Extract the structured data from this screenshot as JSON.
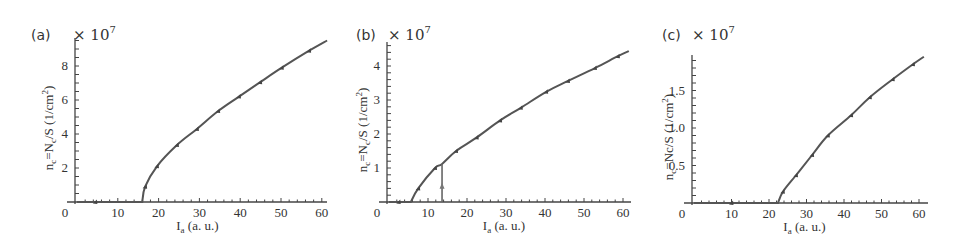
{
  "chart_data": [
    {
      "type": "line",
      "panel_label": "(a)",
      "multiplier": "× 10",
      "multiplier_exp": "7",
      "xlabel": "I",
      "xlabel_sub": "a",
      "xlabel_unit": " (a. u.)",
      "ylabel": "n",
      "ylabel_sub": "c",
      "ylabel_mid": "=N",
      "ylabel_mid_sub": "c",
      "ylabel_rest": "/S (1/cm",
      "ylabel_sup": "2",
      "ylabel_end": ")",
      "xlim": [
        0,
        62
      ],
      "ylim": [
        0,
        9.6
      ],
      "xticks": [
        0,
        10,
        20,
        30,
        40,
        50,
        60
      ],
      "xtick_labels": [
        "0",
        "10",
        "20",
        "30",
        "40",
        "50",
        "60"
      ],
      "yticks": [
        2,
        4,
        6,
        8
      ],
      "ytick_labels": [
        "2",
        "4",
        "6",
        "8"
      ],
      "y_minor_step": 0.5,
      "x_minor_step": 2,
      "series": [
        {
          "name": "n_c",
          "x": [
            0,
            16,
            16.7,
            19.6,
            24.5,
            29.4,
            34.6,
            39.7,
            44.9,
            50.2,
            56.9,
            61.3
          ],
          "y": [
            0,
            0,
            0.9,
            2.1,
            3.35,
            4.3,
            5.35,
            6.2,
            7.05,
            7.9,
            8.9,
            9.5
          ]
        }
      ],
      "markers_x": [
        4.5,
        16.7,
        19.6,
        24.5,
        29.4,
        34.6,
        39.7,
        44.9,
        50.2,
        56.9
      ],
      "threshold": 16,
      "layout": {
        "x0": 77,
        "y0": 202,
        "px_per_x": 4.08,
        "px_per_y": 17,
        "axis_top": 38,
        "axis_right": 327,
        "label_x": 31,
        "label_y": 40,
        "mult_x": 73,
        "ylabel_x": 53
      }
    },
    {
      "type": "line",
      "panel_label": "(b)",
      "multiplier": "× 10",
      "multiplier_exp": "7",
      "xlabel": "I",
      "xlabel_sub": "a",
      "xlabel_unit": " (a. u.)",
      "ylabel": "n",
      "ylabel_sub": "c",
      "ylabel_mid": "=N",
      "ylabel_mid_sub": "c",
      "ylabel_rest": "/S (1/cm",
      "ylabel_sup": "2",
      "ylabel_end": ")",
      "xlim": [
        0,
        62
      ],
      "ylim": [
        0,
        4.7
      ],
      "xticks": [
        0,
        10,
        20,
        30,
        40,
        50,
        60
      ],
      "xtick_labels": [
        "0",
        "10",
        "20",
        "30",
        "40",
        "50",
        "60"
      ],
      "yticks": [
        1,
        2,
        3,
        4
      ],
      "ytick_labels": [
        "1",
        "2",
        "3",
        "4"
      ],
      "y_minor_step": 0.2,
      "x_minor_step": 2,
      "series": [
        {
          "name": "n_c",
          "x": [
            0,
            5.6,
            7.5,
            11.8,
            13.6,
            17.2,
            22.5,
            28.5,
            33.8,
            40.3,
            45.9,
            52.8,
            58.7,
            61.5
          ],
          "y": [
            0,
            0,
            0.4,
            1.0,
            1.12,
            1.5,
            1.9,
            2.4,
            2.77,
            3.24,
            3.56,
            3.94,
            4.29,
            4.44
          ]
        }
      ],
      "markers_x": [
        2.5,
        7.5,
        11.8,
        17.2,
        22.5,
        28.5,
        33.8,
        40.3,
        45.9,
        52.8,
        58.7
      ],
      "vertical_line": {
        "x": 13.6,
        "y_top": 1.12,
        "arrow_y": 0.45
      },
      "threshold": 5.6,
      "layout": {
        "x0": 389,
        "y0": 202,
        "px_per_x": 3.9,
        "px_per_y": 34,
        "axis_top": 42,
        "axis_right": 631,
        "label_x": 356,
        "label_y": 40,
        "mult_x": 388,
        "ylabel_x": 367
      }
    },
    {
      "type": "line",
      "panel_label": "(c)",
      "multiplier": "× 10",
      "multiplier_exp": "7",
      "xlabel": "I",
      "xlabel_sub": "a",
      "xlabel_unit": " (a. u.)",
      "ylabel": "n",
      "ylabel_sub": "c",
      "ylabel_mid": "=Nc",
      "ylabel_mid_sub": "",
      "ylabel_rest": "/S (1/cm",
      "ylabel_sup": "2",
      "ylabel_end": ")",
      "xlim": [
        0,
        62
      ],
      "ylim": [
        0,
        1.97
      ],
      "xticks": [
        0,
        10,
        20,
        30,
        40,
        50,
        60
      ],
      "xtick_labels": [
        "0",
        "10",
        "20",
        "30",
        "40",
        "50",
        "60"
      ],
      "yticks": [
        0.5,
        1.0,
        1.5
      ],
      "ytick_labels": [
        "0.5",
        "1.0",
        "1.5"
      ],
      "y_minor_step": 0.1,
      "x_minor_step": 2,
      "series": [
        {
          "name": "n_c",
          "x": [
            0,
            22.4,
            23.7,
            27.2,
            31.5,
            35.7,
            41.9,
            46.9,
            53.0,
            58.4,
            61.3
          ],
          "y": [
            0,
            0,
            0.15,
            0.37,
            0.64,
            0.9,
            1.17,
            1.41,
            1.65,
            1.85,
            1.95
          ]
        }
      ],
      "markers_x": [
        10,
        23.7,
        27.2,
        31.5,
        35.7,
        41.9,
        46.9,
        53.0,
        58.4
      ],
      "threshold": 22.4,
      "layout": {
        "x0": 694,
        "y0": 203,
        "px_per_x": 3.75,
        "px_per_y": 75,
        "axis_top": 55,
        "axis_right": 928,
        "label_x": 662,
        "label_y": 40,
        "mult_x": 692,
        "ylabel_x": 673
      }
    }
  ]
}
